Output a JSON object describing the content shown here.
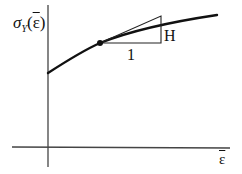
{
  "diagram": {
    "type": "yield-stress-hardening-curve",
    "y_axis": {
      "label_symbol": "σ",
      "label_subscript": "Y",
      "label_open": "(",
      "label_arg": "ε",
      "label_close": ")"
    },
    "x_axis": {
      "label": "ε"
    },
    "slope_triangle": {
      "run_label": "1",
      "rise_label": "H"
    },
    "colors": {
      "line": "#111111",
      "axis": "#444444",
      "triangle": "#222222",
      "background": "#ffffff"
    }
  }
}
